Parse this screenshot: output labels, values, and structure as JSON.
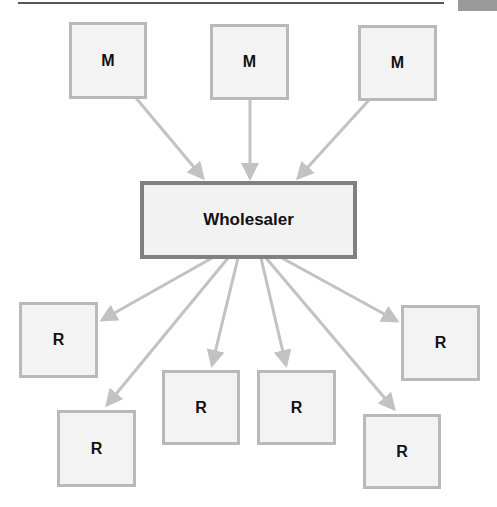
{
  "diagram": {
    "type": "distribution-channel",
    "colors": {
      "box_fill": "#f3f3f3",
      "box_border": "#b9b9b9",
      "wholesaler_border": "#808080",
      "arrow": "#c2c2c2",
      "text": "#111111"
    },
    "manufacturers": [
      {
        "label": "M"
      },
      {
        "label": "M"
      },
      {
        "label": "M"
      }
    ],
    "wholesaler": {
      "label": "Wholesaler"
    },
    "retailers": [
      {
        "label": "R"
      },
      {
        "label": "R"
      },
      {
        "label": "R"
      },
      {
        "label": "R"
      },
      {
        "label": "R"
      },
      {
        "label": "R"
      }
    ],
    "edges": [
      {
        "from": "M1",
        "to": "Wholesaler"
      },
      {
        "from": "M2",
        "to": "Wholesaler"
      },
      {
        "from": "M3",
        "to": "Wholesaler"
      },
      {
        "from": "Wholesaler",
        "to": "R1"
      },
      {
        "from": "Wholesaler",
        "to": "R2"
      },
      {
        "from": "Wholesaler",
        "to": "R3"
      },
      {
        "from": "Wholesaler",
        "to": "R4"
      },
      {
        "from": "Wholesaler",
        "to": "R5"
      },
      {
        "from": "Wholesaler",
        "to": "R6"
      }
    ]
  }
}
